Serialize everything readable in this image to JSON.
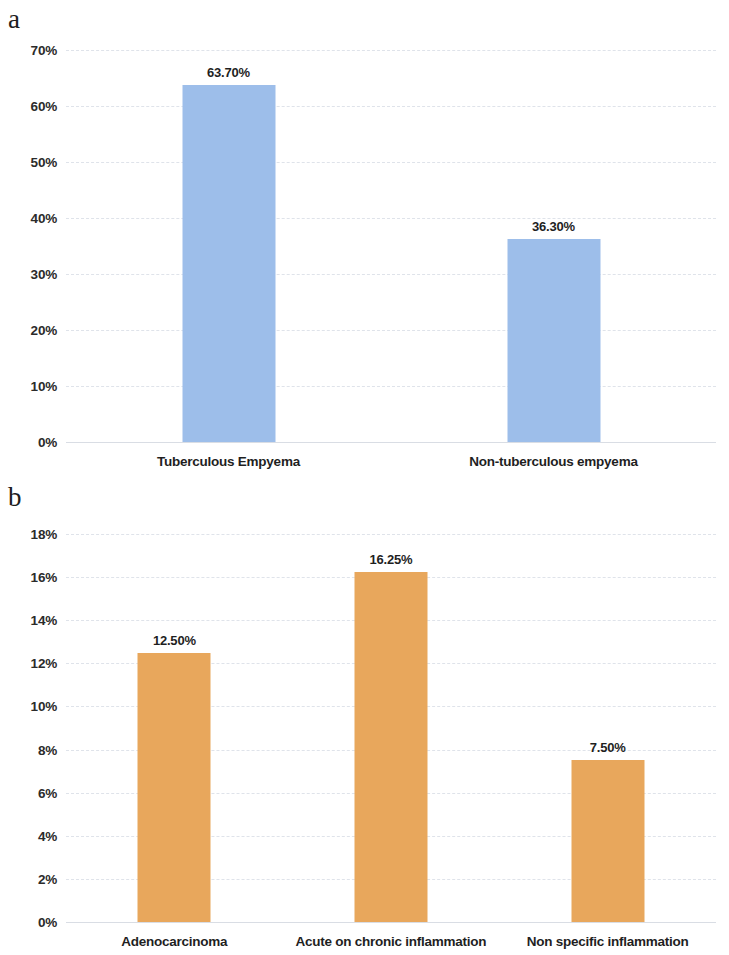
{
  "figure": {
    "panels": [
      {
        "letter": "a",
        "chart_data": {
          "type": "bar",
          "title": "",
          "xlabel": "",
          "ylabel": "",
          "categories": [
            "Tuberculous Empyema",
            "Non-tuberculous empyema"
          ],
          "values": [
            63.7,
            36.3
          ],
          "value_labels": [
            "63.70%",
            "36.30%"
          ],
          "ylim": [
            0,
            70
          ],
          "ytick_values": [
            0,
            10,
            20,
            30,
            40,
            50,
            60,
            70
          ],
          "ytick_labels": [
            "0%",
            "10%",
            "20%",
            "30%",
            "40%",
            "50%",
            "60%",
            "70%"
          ],
          "grid": true,
          "legend": "none",
          "bar_color": "#9dbeea"
        }
      },
      {
        "letter": "b",
        "chart_data": {
          "type": "bar",
          "title": "",
          "xlabel": "",
          "ylabel": "",
          "categories": [
            "Adenocarcinoma",
            "Acute on chronic inflammation",
            "Non specific inflammation"
          ],
          "values": [
            12.5,
            16.25,
            7.5
          ],
          "value_labels": [
            "12.50%",
            "16.25%",
            "7.50%"
          ],
          "ylim": [
            0,
            18
          ],
          "ytick_values": [
            0,
            2,
            4,
            6,
            8,
            10,
            12,
            14,
            16,
            18
          ],
          "ytick_labels": [
            "0%",
            "2%",
            "4%",
            "6%",
            "8%",
            "10%",
            "12%",
            "14%",
            "16%",
            "18%"
          ],
          "grid": true,
          "legend": "none",
          "bar_color": "#e8a75c"
        }
      }
    ]
  }
}
